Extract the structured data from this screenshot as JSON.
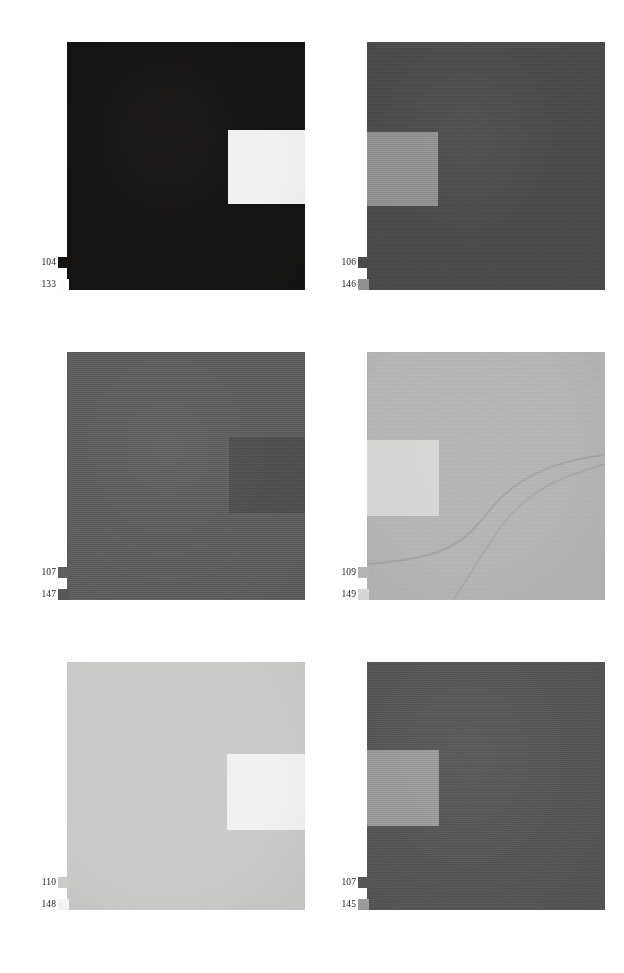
{
  "figure": {
    "background_color": "#ffffff",
    "layout": "2-columns-by-3-rows",
    "panel_count": 6
  },
  "panels": [
    {
      "id": "panel-1",
      "background_color": "#141312",
      "patch_color": "#f2f1ed",
      "patch_side": "right",
      "has_curve": false,
      "labels": {
        "top": {
          "value": "104",
          "swatch_color": "#141312"
        },
        "bottom": {
          "value": "133",
          "swatch_color": "#fdfdfd"
        }
      }
    },
    {
      "id": "panel-2",
      "background_color": "#4b4b4b",
      "patch_color": "#909090",
      "patch_side": "left",
      "has_curve": false,
      "labels": {
        "top": {
          "value": "106",
          "swatch_color": "#4b4b4b"
        },
        "bottom": {
          "value": "146",
          "swatch_color": "#909090"
        }
      }
    },
    {
      "id": "panel-3",
      "background_color": "#5e5e5e",
      "patch_color": "#4f4f4f",
      "patch_side": "right",
      "has_curve": false,
      "labels": {
        "top": {
          "value": "107",
          "swatch_color": "#5e5e5e"
        },
        "bottom": {
          "value": "147",
          "swatch_color": "#575757"
        }
      }
    },
    {
      "id": "panel-4",
      "background_color": "#b4b4b4",
      "patch_color": "#d6d6d4",
      "patch_side": "left",
      "has_curve": true,
      "labels": {
        "top": {
          "value": "109",
          "swatch_color": "#b4b4b4"
        },
        "bottom": {
          "value": "149",
          "swatch_color": "#d6d6d4"
        }
      }
    },
    {
      "id": "panel-5",
      "background_color": "#cacac8",
      "patch_color": "#f1f1ef",
      "patch_side": "right",
      "has_curve": false,
      "labels": {
        "top": {
          "value": "110",
          "swatch_color": "#cacac8"
        },
        "bottom": {
          "value": "148",
          "swatch_color": "#f4f4f2"
        }
      }
    },
    {
      "id": "panel-6",
      "background_color": "#565656",
      "patch_color": "#9a9a9a",
      "patch_side": "left",
      "has_curve": false,
      "labels": {
        "top": {
          "value": "107",
          "swatch_color": "#565656"
        },
        "bottom": {
          "value": "145",
          "swatch_color": "#9a9a9a"
        }
      }
    }
  ]
}
